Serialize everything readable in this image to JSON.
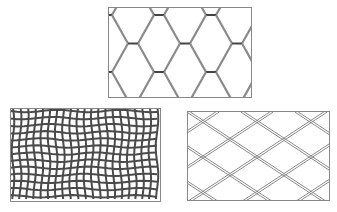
{
  "figure": {
    "background": "#ffffff",
    "stroke_color": "#7a7a7a",
    "dark_stroke": "#3a3a3a",
    "panels": [
      {
        "id": "hexagonal-mesh",
        "label": "",
        "pattern": "hexagonal"
      },
      {
        "id": "woven-square-mesh",
        "label": "",
        "pattern": "woven-square"
      },
      {
        "id": "chain-link-mesh",
        "label": "",
        "pattern": "diamond"
      }
    ]
  }
}
